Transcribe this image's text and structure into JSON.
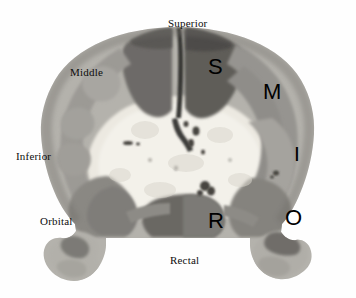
{
  "figure": {
    "background_color": "#fefefe",
    "width": 356,
    "height": 298
  },
  "external_labels": [
    {
      "id": "superior",
      "text": "Superior",
      "x": 168,
      "y": 18
    },
    {
      "id": "middle",
      "text": "Middle",
      "x": 70,
      "y": 67
    },
    {
      "id": "inferior",
      "text": "Inferior",
      "x": 16,
      "y": 151
    },
    {
      "id": "orbital",
      "text": "Orbital",
      "x": 40,
      "y": 216
    },
    {
      "id": "rectal",
      "text": "Rectal",
      "x": 170,
      "y": 255
    }
  ],
  "region_letters": [
    {
      "id": "S",
      "text": "S",
      "label": "Superior frontal gyrus",
      "x": 208,
      "y": 56
    },
    {
      "id": "M",
      "text": "M",
      "label": "Middle frontal gyrus",
      "x": 263,
      "y": 81
    },
    {
      "id": "I",
      "text": "I",
      "label": "Inferior frontal gyrus",
      "x": 294,
      "y": 143
    },
    {
      "id": "O",
      "text": "O",
      "label": "Orbital gyrus",
      "x": 285,
      "y": 207
    },
    {
      "id": "R",
      "text": "R",
      "label": "Gyrus rectus",
      "x": 208,
      "y": 210
    }
  ],
  "tissue_colors": {
    "white_matter": "#eceae2",
    "white_matter_core": "#f2f0ea",
    "cortex_light": "#b6b4ae",
    "cortex_mid": "#9b9994",
    "cortex_dark": "#86847f",
    "superior_dark": "#6e6c68",
    "superior_darker": "#5c5a57",
    "temporal_pole": "#b2b0aa",
    "fissure": "#3b3a38",
    "speckle": "#4a4846"
  }
}
